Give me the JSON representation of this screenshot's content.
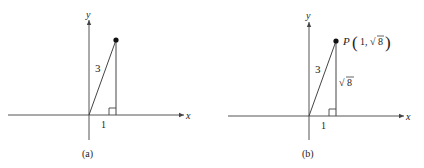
{
  "panels": [
    {
      "id": "a",
      "caption": "(a)",
      "x_axis_label": "x",
      "y_axis_label": "y",
      "hypotenuse_label": "3",
      "base_label": "1",
      "vertical_label": "",
      "point_label": ""
    },
    {
      "id": "b",
      "caption": "(b)",
      "x_axis_label": "x",
      "y_axis_label": "y",
      "hypotenuse_label": "3",
      "base_label": "1",
      "vertical_label": "8",
      "vertical_label_radical": "√",
      "point_label": {
        "name": "P",
        "open_paren": "(",
        "x": "1,",
        "radical": "√",
        "y_radicand": "8",
        "close_paren": ")"
      }
    }
  ],
  "colors": {
    "axis": "#555555",
    "line": "#444444",
    "point": "#111111",
    "text": "#222222"
  }
}
